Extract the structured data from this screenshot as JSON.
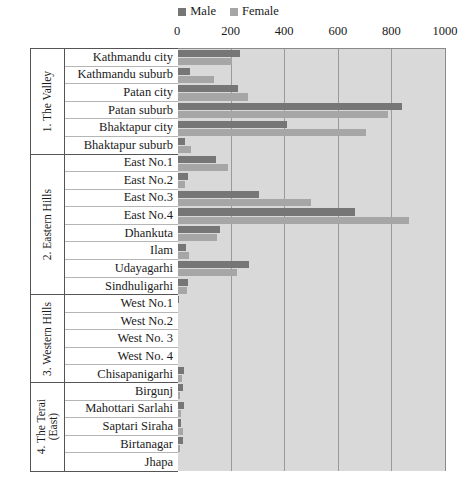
{
  "chart_data": {
    "type": "bar",
    "orientation": "horizontal",
    "title": "",
    "subtitle": "",
    "xlabel": "",
    "ylabel": "",
    "xlim": [
      0,
      1000
    ],
    "xticks": [
      0,
      200,
      400,
      600,
      800,
      1000
    ],
    "grid": true,
    "legend_position": "top-center",
    "legend": [
      "Male",
      "Female"
    ],
    "colors": {
      "male": "#767676",
      "female": "#a6a6a6",
      "plot_background": "#d9d9d9",
      "gridline": "#9a9a9a",
      "frame": "#555555"
    },
    "groups": [
      {
        "name": "1. The Valley",
        "categories": [
          "Kathmandu city",
          "Kathmandu suburb",
          "Patan city",
          "Patan suburb",
          "Bhaktapur city",
          "Bhaktapur suburb"
        ],
        "male": [
          236,
          48,
          228,
          840,
          410,
          30
        ],
        "female": [
          206,
          138,
          266,
          787,
          705,
          52
        ]
      },
      {
        "name": "2. Eastern Hills",
        "categories": [
          "East No.1",
          "East No.2",
          "East No.3",
          "East No.4",
          "Dhankuta",
          "Ilam",
          "Udayagarhi",
          "Sindhuligarhi"
        ],
        "male": [
          145,
          40,
          305,
          665,
          160,
          33,
          270,
          40
        ],
        "female": [
          190,
          28,
          500,
          865,
          148,
          45,
          225,
          38
        ]
      },
      {
        "name": "3. Western Hills",
        "categories": [
          "West No.1",
          "West No.2",
          "West No. 3",
          "West No. 4",
          "Chisapanigarhi"
        ],
        "male": [
          6,
          0,
          0,
          0,
          26
        ],
        "female": [
          4,
          0,
          0,
          2,
          18
        ]
      },
      {
        "name": "4. The Terai\n(East)",
        "categories": [
          "Birgunj",
          "Mahottari Sarlahi",
          "Saptari Siraha",
          "Birtanagar",
          "Jhapa"
        ],
        "male": [
          22,
          26,
          16,
          24,
          0
        ],
        "female": [
          10,
          14,
          22,
          12,
          0
        ]
      }
    ]
  },
  "legend": {
    "male_label": "Male",
    "female_label": "Female"
  },
  "axis": {
    "tick_labels": [
      "0",
      "200",
      "400",
      "600",
      "800",
      "1000"
    ]
  }
}
